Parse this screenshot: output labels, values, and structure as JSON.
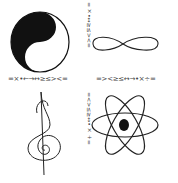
{
  "image": {
    "description": "Four hand-drawn symbols separated by rows of mathematical symbols",
    "quadrants": [
      {
        "position": "top-left",
        "symbol": "yin-yang"
      },
      {
        "position": "top-right",
        "symbol": "infinity"
      },
      {
        "position": "bottom-left",
        "symbol": "treble-clef"
      },
      {
        "position": "bottom-right",
        "symbol": "atom"
      }
    ],
    "divider_horizontal": {
      "left_text": "=×•←→↔≥≤><=",
      "right_text": "=><≥≤↔→•×÷="
    },
    "divider_vertical": {
      "top_text": "=×•↔≥≤><=",
      "bottom_text": "=<>≤≥↔•×÷="
    },
    "colors": {
      "ink": "#111111",
      "background": "#ffffff",
      "divider_text": "#444444"
    }
  }
}
